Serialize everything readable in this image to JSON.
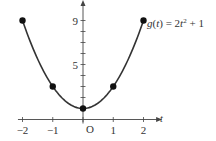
{
  "chart_data": {
    "type": "line",
    "title": "",
    "function_label": "g(t) = 2t² + 1",
    "function_label_parts": {
      "prefix": "g(",
      "var": "t",
      "mid": ") = 2",
      "var2": "t",
      "sup": "2",
      "suffix": " + 1"
    },
    "xlabel": "t",
    "ylabel": "",
    "origin_label": "O",
    "xlim": [
      -2.1,
      2.5
    ],
    "ylim": [
      0,
      10.5
    ],
    "x_ticks": [
      -2,
      -1,
      0,
      1,
      2
    ],
    "x_tick_labels": [
      "−2",
      "−1",
      "",
      "1",
      "2"
    ],
    "y_ticks": [
      1,
      2,
      3,
      4,
      5,
      6,
      7,
      8,
      9
    ],
    "y_tick_labels": [
      {
        "value": 5,
        "label": "5"
      },
      {
        "value": 9,
        "label": "9"
      }
    ],
    "curve": {
      "expression": "2*t^2+1",
      "t_range": [
        -2,
        2
      ]
    },
    "points": [
      {
        "t": -2,
        "y": 9
      },
      {
        "t": -1,
        "y": 3
      },
      {
        "t": 0,
        "y": 1
      },
      {
        "t": 1,
        "y": 3
      },
      {
        "t": 2,
        "y": 9
      }
    ],
    "grid": false,
    "legend": "none",
    "colors": {
      "curve": "#333333",
      "axis": "#444444",
      "points": "#111111"
    }
  }
}
